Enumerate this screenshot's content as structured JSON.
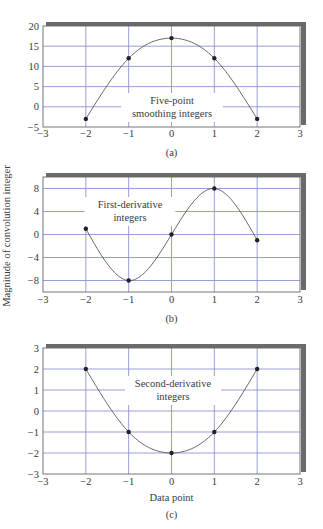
{
  "figure": {
    "shared_ylabel": "Magnitude of convolution integer"
  },
  "chart_data": [
    {
      "type": "line",
      "caption": "(a)",
      "title": "",
      "annotation": [
        "Five-point",
        "smoothing integers"
      ],
      "xlabel": "",
      "ylabel": "Magnitude of convolution integer",
      "x": [
        -2,
        -1,
        0,
        1,
        2
      ],
      "series": [
        {
          "name": "Five-point smoothing integers",
          "values": [
            -3,
            12,
            17,
            12,
            -3
          ]
        }
      ],
      "xlim": [
        -3,
        3
      ],
      "ylim": [
        -5,
        20
      ],
      "xticks": [
        -3,
        -2,
        -1,
        0,
        1,
        2,
        3
      ],
      "xtick_labels": [
        "−3",
        "−2",
        "−1",
        "0",
        "1",
        "2",
        "3"
      ],
      "yticks": [
        -5,
        0,
        5,
        10,
        15,
        20
      ],
      "ytick_labels": [
        "−5",
        "0",
        "5",
        "10",
        "15",
        "20"
      ],
      "grid": true,
      "curve": "smooth-interpolated",
      "colors": {
        "grid": "#8f93d4",
        "curve": "#555555",
        "marker": "#222222",
        "frame": "#666666",
        "shadow": "#6a6a6a"
      }
    },
    {
      "type": "line",
      "caption": "(b)",
      "title": "",
      "annotation": [
        "First-derivative",
        "integers"
      ],
      "xlabel": "",
      "ylabel": "Magnitude of convolution integer",
      "x": [
        -2,
        -1,
        0,
        1,
        2
      ],
      "series": [
        {
          "name": "First-derivative integers",
          "values": [
            1,
            -8,
            0,
            8,
            -1
          ]
        }
      ],
      "xlim": [
        -3,
        3
      ],
      "ylim": [
        -10,
        10
      ],
      "xticks": [
        -3,
        -2,
        -1,
        0,
        1,
        2,
        3
      ],
      "xtick_labels": [
        "−3",
        "−2",
        "−1",
        "0",
        "1",
        "2",
        "3"
      ],
      "yticks": [
        -8,
        -4,
        0,
        4,
        8
      ],
      "ytick_labels": [
        "−8",
        "−4",
        "0",
        "4",
        "8"
      ],
      "grid": true,
      "curve": "smooth-interpolated",
      "colors": {
        "grid": "#8f93d4",
        "curve": "#555555",
        "marker": "#222222",
        "frame": "#666666",
        "shadow": "#6a6a6a"
      }
    },
    {
      "type": "line",
      "caption": "(c)",
      "title": "",
      "annotation": [
        "Second-derivative",
        "integers"
      ],
      "xlabel": "Data point",
      "ylabel": "Magnitude of convolution integer",
      "x": [
        -2,
        -1,
        0,
        1,
        2
      ],
      "series": [
        {
          "name": "Second-derivative integers",
          "values": [
            2,
            -1,
            -2,
            -1,
            2
          ]
        }
      ],
      "xlim": [
        -3,
        3
      ],
      "ylim": [
        -3,
        3
      ],
      "xticks": [
        -3,
        -2,
        -1,
        0,
        1,
        2,
        3
      ],
      "xtick_labels": [
        "−3",
        "−2",
        "−1",
        "0",
        "1",
        "2",
        "3"
      ],
      "yticks": [
        -3,
        -2,
        -1,
        0,
        1,
        2,
        3
      ],
      "ytick_labels": [
        "−3",
        "−2",
        "−1",
        "0",
        "1",
        "2",
        "3"
      ],
      "grid": true,
      "curve": "smooth-interpolated",
      "colors": {
        "grid": "#8f93d4",
        "curve": "#555555",
        "marker": "#222222",
        "frame": "#666666",
        "shadow": "#6a6a6a"
      }
    }
  ]
}
